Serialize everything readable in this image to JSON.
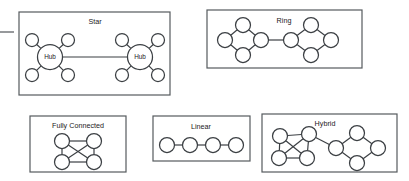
{
  "figure": {
    "kind": "network-topology-diagram",
    "background_color": "#ffffff",
    "stroke_color": "#3b3f43",
    "frame_color": "#555a5e",
    "node_fill": "#ffffff"
  },
  "panels": [
    {
      "id": "star",
      "caption": "Star",
      "frame": {
        "x": 19,
        "y": 12,
        "width": 151,
        "height": 83
      },
      "caption_pos": {
        "x": 95,
        "y": 22
      },
      "nodes": [
        {
          "name": "hub-left",
          "cx": 50,
          "cy": 57,
          "r": 12.5,
          "label": "Hub"
        },
        {
          "name": "hub-right",
          "cx": 140,
          "cy": 57,
          "r": 12.5,
          "label": "Hub"
        },
        {
          "name": "leaf-left-top-left",
          "cx": 32,
          "cy": 40,
          "r": 6.5,
          "label": ""
        },
        {
          "name": "leaf-left-top-right",
          "cx": 68,
          "cy": 40,
          "r": 6.5,
          "label": ""
        },
        {
          "name": "leaf-left-bottom-left",
          "cx": 32,
          "cy": 75,
          "r": 6.5,
          "label": ""
        },
        {
          "name": "leaf-left-bottom-right",
          "cx": 68,
          "cy": 75,
          "r": 6.5,
          "label": ""
        },
        {
          "name": "leaf-right-top-left",
          "cx": 122,
          "cy": 40,
          "r": 6.5,
          "label": ""
        },
        {
          "name": "leaf-right-top-right",
          "cx": 158,
          "cy": 40,
          "r": 6.5,
          "label": ""
        },
        {
          "name": "leaf-right-bottom-left",
          "cx": 122,
          "cy": 75,
          "r": 6.5,
          "label": ""
        },
        {
          "name": "leaf-right-bottom-right",
          "cx": 158,
          "cy": 75,
          "r": 6.5,
          "label": ""
        }
      ],
      "edges": [
        {
          "from": "hub-left",
          "to": "leaf-left-top-left"
        },
        {
          "from": "hub-left",
          "to": "leaf-left-top-right"
        },
        {
          "from": "hub-left",
          "to": "leaf-left-bottom-left"
        },
        {
          "from": "hub-left",
          "to": "leaf-left-bottom-right"
        },
        {
          "from": "hub-right",
          "to": "leaf-right-top-left"
        },
        {
          "from": "hub-right",
          "to": "leaf-right-top-right"
        },
        {
          "from": "hub-right",
          "to": "leaf-right-bottom-left"
        },
        {
          "from": "hub-right",
          "to": "leaf-right-bottom-right"
        },
        {
          "from": "hub-left",
          "to": "hub-right"
        }
      ]
    },
    {
      "id": "ring",
      "caption": "Ring",
      "frame": {
        "x": 207,
        "y": 10,
        "width": 155,
        "height": 58
      },
      "caption_pos": {
        "x": 284,
        "y": 21
      },
      "nodes": [
        {
          "name": "ring-left-top",
          "cx": 243,
          "cy": 25,
          "r": 7.5,
          "label": ""
        },
        {
          "name": "ring-left-west",
          "cx": 225,
          "cy": 40,
          "r": 7.5,
          "label": ""
        },
        {
          "name": "ring-left-east",
          "cx": 261,
          "cy": 40,
          "r": 7.5,
          "label": ""
        },
        {
          "name": "ring-left-bottom",
          "cx": 243,
          "cy": 55,
          "r": 7.5,
          "label": ""
        },
        {
          "name": "ring-right-west",
          "cx": 291,
          "cy": 40,
          "r": 7.5,
          "label": ""
        },
        {
          "name": "ring-right-top",
          "cx": 311,
          "cy": 25,
          "r": 7.5,
          "label": ""
        },
        {
          "name": "ring-right-east",
          "cx": 331,
          "cy": 40,
          "r": 7.5,
          "label": ""
        },
        {
          "name": "ring-right-bottom",
          "cx": 311,
          "cy": 55,
          "r": 7.5,
          "label": ""
        }
      ],
      "edges": [
        {
          "from": "ring-left-top",
          "to": "ring-left-west"
        },
        {
          "from": "ring-left-top",
          "to": "ring-left-east"
        },
        {
          "from": "ring-left-bottom",
          "to": "ring-left-west"
        },
        {
          "from": "ring-left-bottom",
          "to": "ring-left-east"
        },
        {
          "from": "ring-right-top",
          "to": "ring-right-west"
        },
        {
          "from": "ring-right-top",
          "to": "ring-right-east"
        },
        {
          "from": "ring-right-bottom",
          "to": "ring-right-west"
        },
        {
          "from": "ring-right-bottom",
          "to": "ring-right-east"
        },
        {
          "from": "ring-left-east",
          "to": "ring-right-west"
        }
      ]
    },
    {
      "id": "fully-connected",
      "caption": "Fully Connected",
      "frame": {
        "x": 30,
        "y": 116,
        "width": 96,
        "height": 56
      },
      "caption_pos": {
        "x": 78,
        "y": 126
      },
      "nodes": [
        {
          "name": "fc-top-left",
          "cx": 62,
          "cy": 141,
          "r": 7.5,
          "label": ""
        },
        {
          "name": "fc-top-right",
          "cx": 94,
          "cy": 141,
          "r": 7.5,
          "label": ""
        },
        {
          "name": "fc-bottom-left",
          "cx": 62,
          "cy": 162,
          "r": 7.5,
          "label": ""
        },
        {
          "name": "fc-bottom-right",
          "cx": 94,
          "cy": 162,
          "r": 7.5,
          "label": ""
        }
      ],
      "edges": [
        {
          "from": "fc-top-left",
          "to": "fc-top-right"
        },
        {
          "from": "fc-top-left",
          "to": "fc-bottom-left"
        },
        {
          "from": "fc-top-right",
          "to": "fc-bottom-right"
        },
        {
          "from": "fc-bottom-left",
          "to": "fc-bottom-right"
        },
        {
          "from": "fc-top-left",
          "to": "fc-bottom-right"
        },
        {
          "from": "fc-top-right",
          "to": "fc-bottom-left"
        }
      ]
    },
    {
      "id": "linear",
      "caption": "Linear",
      "frame": {
        "x": 153,
        "y": 116,
        "width": 97,
        "height": 45
      },
      "caption_pos": {
        "x": 201,
        "y": 127
      },
      "nodes": [
        {
          "name": "lin-node-1",
          "cx": 167,
          "cy": 145,
          "r": 7.5,
          "label": ""
        },
        {
          "name": "lin-node-2",
          "cx": 190,
          "cy": 145,
          "r": 7.5,
          "label": ""
        },
        {
          "name": "lin-node-3",
          "cx": 213,
          "cy": 145,
          "r": 7.5,
          "label": ""
        },
        {
          "name": "lin-node-4",
          "cx": 236,
          "cy": 145,
          "r": 7.5,
          "label": ""
        }
      ],
      "edges": [
        {
          "from": "lin-node-1",
          "to": "lin-node-2"
        },
        {
          "from": "lin-node-2",
          "to": "lin-node-3"
        },
        {
          "from": "lin-node-3",
          "to": "lin-node-4"
        }
      ]
    },
    {
      "id": "hybrid",
      "caption": "Hybrid",
      "frame": {
        "x": 262,
        "y": 114,
        "width": 135,
        "height": 58
      },
      "caption_pos": {
        "x": 325,
        "y": 124
      },
      "nodes": [
        {
          "name": "hyb-fc-top-left",
          "cx": 280,
          "cy": 136,
          "r": 7.5,
          "label": ""
        },
        {
          "name": "hyb-fc-top-right",
          "cx": 309,
          "cy": 134,
          "r": 7.5,
          "label": ""
        },
        {
          "name": "hyb-fc-bottom-left",
          "cx": 279,
          "cy": 158,
          "r": 7.5,
          "label": ""
        },
        {
          "name": "hyb-fc-bottom-right",
          "cx": 307,
          "cy": 158,
          "r": 7.5,
          "label": ""
        },
        {
          "name": "hyb-ring-west",
          "cx": 336,
          "cy": 148,
          "r": 7.5,
          "label": ""
        },
        {
          "name": "hyb-ring-top",
          "cx": 357,
          "cy": 133,
          "r": 7.5,
          "label": ""
        },
        {
          "name": "hyb-ring-east",
          "cx": 378,
          "cy": 148,
          "r": 7.5,
          "label": ""
        },
        {
          "name": "hyb-ring-bottom",
          "cx": 357,
          "cy": 163,
          "r": 7.5,
          "label": ""
        }
      ],
      "edges": [
        {
          "from": "hyb-fc-top-left",
          "to": "hyb-fc-top-right"
        },
        {
          "from": "hyb-fc-top-left",
          "to": "hyb-fc-bottom-left"
        },
        {
          "from": "hyb-fc-top-right",
          "to": "hyb-fc-bottom-right"
        },
        {
          "from": "hyb-fc-bottom-left",
          "to": "hyb-fc-bottom-right"
        },
        {
          "from": "hyb-fc-top-left",
          "to": "hyb-fc-bottom-right"
        },
        {
          "from": "hyb-fc-top-right",
          "to": "hyb-fc-bottom-left"
        },
        {
          "from": "hyb-fc-top-right",
          "to": "hyb-ring-west"
        },
        {
          "from": "hyb-ring-top",
          "to": "hyb-ring-west"
        },
        {
          "from": "hyb-ring-top",
          "to": "hyb-ring-east"
        },
        {
          "from": "hyb-ring-bottom",
          "to": "hyb-ring-west"
        },
        {
          "from": "hyb-ring-bottom",
          "to": "hyb-ring-east"
        }
      ]
    }
  ],
  "stubs": [
    {
      "name": "left-edge-connector-stub",
      "x1": 0,
      "y1": 32,
      "x2": 14,
      "y2": 32
    }
  ]
}
